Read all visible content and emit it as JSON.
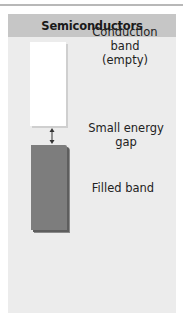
{
  "diagram": {
    "title": "Semiconductors",
    "bands": [
      {
        "id": "conduction",
        "label_lines": [
          "Conduction",
          "band",
          "(empty)"
        ],
        "fill": "#ffffff"
      },
      {
        "id": "filled",
        "label_lines": [
          "Filled band"
        ],
        "fill": "#7d7d7d"
      }
    ],
    "gap": {
      "label_lines": [
        "Small energy",
        "gap"
      ],
      "icon": "double-arrow-vertical"
    },
    "colors": {
      "header": "#c6c6c6",
      "panel": "#ececec",
      "filled_band": "#7d7d7d",
      "conduction_band": "#ffffff"
    }
  }
}
